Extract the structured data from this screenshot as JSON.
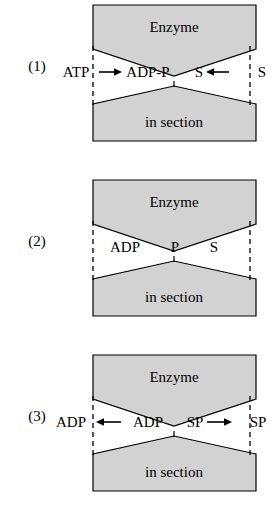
{
  "figure": {
    "type": "schematic-diagram",
    "colors": {
      "shape_fill": "#d2d2d2",
      "stroke": "#000000",
      "background": "#ffffff",
      "dashed_line": "#000000"
    },
    "shape_labels": {
      "top": "Enzyme",
      "bottom": "in section"
    }
  },
  "panels": [
    {
      "index": "(1)",
      "name": "panel-1",
      "top_shape_label": "Enzyme",
      "bottom_shape_label": "in section",
      "left": {
        "outer_label": "ATP",
        "inner_label": "ADP-P",
        "arrow": "right",
        "arrow_glyph": "→"
      },
      "right": {
        "inner_label": "S",
        "outer_label": "S",
        "arrow": "left",
        "arrow_glyph": "←"
      }
    },
    {
      "index": "(2)",
      "name": "panel-2",
      "top_shape_label": "Enzyme",
      "bottom_shape_label": "in section",
      "left": {
        "outer_label": "",
        "inner_label": "ADP",
        "arrow": "none",
        "arrow_glyph": ""
      },
      "center": {
        "label": "P"
      },
      "right": {
        "inner_label": "S",
        "outer_label": "",
        "arrow": "none",
        "arrow_glyph": ""
      }
    },
    {
      "index": "(3)",
      "name": "panel-3",
      "top_shape_label": "Enzyme",
      "bottom_shape_label": "in section",
      "left": {
        "outer_label": "ADP",
        "inner_label": "ADP",
        "arrow": "left",
        "arrow_glyph": "←"
      },
      "right": {
        "inner_label": "SP",
        "outer_label": "SP",
        "arrow": "right",
        "arrow_glyph": "→"
      }
    }
  ]
}
